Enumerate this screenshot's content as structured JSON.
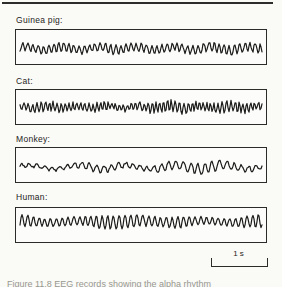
{
  "page": {
    "background": "#fafaf7",
    "ink": "#1b1b19"
  },
  "figure": {
    "panels": [
      {
        "id": "guinea-pig",
        "label": "Guinea pig:",
        "wave": {
          "seed": 11,
          "freq": 47,
          "amp": 5.4,
          "envelope": [
            0.8,
            0.72,
            0.85,
            0.7,
            0.8,
            0.9,
            0.75,
            0.8,
            0.7,
            0.85,
            0.95,
            0.8,
            0.9
          ],
          "slow_freq": 6.5,
          "slow_amp": 1.7,
          "slow_phase": 0.8,
          "noise": 0.9,
          "jitter": 0.55,
          "center_ratio": 0.54
        }
      },
      {
        "id": "cat",
        "label": "Cat:",
        "wave": {
          "seed": 29,
          "freq": 61,
          "amp": 6.3,
          "envelope": [
            0.5,
            0.85,
            0.75,
            0.6,
            0.8,
            0.5,
            0.55,
            0.75,
            1.0,
            0.85,
            0.6,
            0.95,
            0.8,
            0.55
          ],
          "slow_freq": 8,
          "slow_amp": 1.1,
          "slow_phase": 2.1,
          "noise": 1.0,
          "jitter": 0.6,
          "center_ratio": 0.5
        }
      },
      {
        "id": "monkey",
        "label": "Monkey:",
        "wave": {
          "seed": 41,
          "freq": 33,
          "amp": 5.6,
          "envelope": [
            0.35,
            0.3,
            0.4,
            0.55,
            0.6,
            0.5,
            0.45,
            0.6,
            0.75,
            0.95,
            0.8,
            0.55,
            0.4
          ],
          "slow_freq": 5,
          "slow_amp": 1.9,
          "slow_phase": 0.3,
          "noise": 1.0,
          "jitter": 0.5,
          "center_ratio": 0.56
        }
      },
      {
        "id": "human",
        "label": "Human:",
        "wave": {
          "seed": 57,
          "freq": 42,
          "amp": 6.8,
          "envelope": [
            0.95,
            0.6,
            0.55,
            0.65,
            0.95,
            1.0,
            0.85,
            0.7,
            0.85,
            0.55,
            0.5,
            0.75,
            1.0
          ],
          "slow_freq": 4,
          "slow_amp": 1.0,
          "slow_phase": 1.5,
          "noise": 0.55,
          "jitter": 0.35,
          "center_ratio": 0.4
        }
      }
    ],
    "scale_bar": {
      "label": "1 s"
    },
    "caption_clipped": "Figure 11.8  EEG records showing the alpha rhythm"
  },
  "chart_data": {
    "type": "line",
    "title": "",
    "series": [
      {
        "name": "Guinea pig",
        "description": "fast fairly regular oscillation, steady moderate amplitude"
      },
      {
        "name": "Cat",
        "description": "high-frequency rhythm with waxing and waning spindle-like bursts"
      },
      {
        "name": "Monkey",
        "description": "slower irregular waves, low amplitude at start, larger bursts toward right"
      },
      {
        "name": "Human",
        "description": "alpha rhythm ~10 Hz with waxing and waning amplitude"
      }
    ],
    "x_scale": {
      "label": "1 s",
      "type": "time-scale-bar"
    }
  }
}
